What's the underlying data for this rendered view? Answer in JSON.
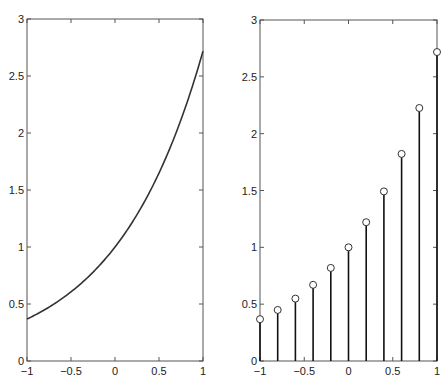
{
  "chart_data": [
    {
      "type": "line",
      "title": "",
      "xlabel": "",
      "ylabel": "",
      "xlim": [
        -1,
        1
      ],
      "ylim": [
        0,
        3
      ],
      "grid": false,
      "legend": null,
      "function": "exp(x)",
      "x": [
        -1,
        -0.8,
        -0.6,
        -0.4,
        -0.2,
        0,
        0.2,
        0.4,
        0.6,
        0.8,
        1
      ],
      "series": [
        {
          "name": "exp(x)",
          "values": [
            0.368,
            0.449,
            0.549,
            0.67,
            0.819,
            1.0,
            1.221,
            1.492,
            1.822,
            2.226,
            2.718
          ]
        }
      ],
      "xticks": [
        "-1",
        "-0.5",
        "0",
        "0.5",
        "1"
      ],
      "yticks": [
        "0",
        "0.5",
        "1",
        "1.5",
        "2",
        "2.5",
        "3"
      ]
    },
    {
      "type": "stem",
      "title": "",
      "xlabel": "",
      "ylabel": "",
      "xlim": [
        -1,
        1
      ],
      "ylim": [
        0,
        3
      ],
      "grid": false,
      "legend": null,
      "x": [
        -1,
        -0.8,
        -0.6,
        -0.4,
        -0.2,
        0,
        0.2,
        0.4,
        0.6,
        0.8,
        1
      ],
      "series": [
        {
          "name": "exp(x) samples",
          "values": [
            0.368,
            0.449,
            0.549,
            0.67,
            0.819,
            1.0,
            1.221,
            1.492,
            1.822,
            2.226,
            2.718
          ]
        }
      ],
      "marker": "circle",
      "xticks": [
        "-1",
        "-0.5",
        "0",
        "0.5",
        "1"
      ],
      "yticks": [
        "0",
        "0.5",
        "1",
        "1.5",
        "2",
        "2.5",
        "3"
      ]
    }
  ]
}
